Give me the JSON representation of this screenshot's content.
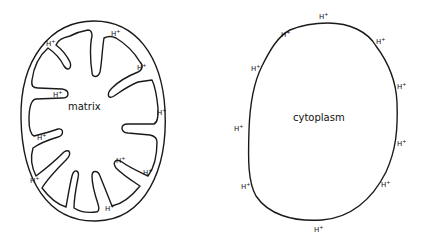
{
  "diagram": {
    "type": "hand-drawn biology sketch",
    "panels": [
      {
        "name": "mitochondrion",
        "region_label": "matrix",
        "ion_label": "H+",
        "ion_count": 10
      },
      {
        "name": "cell",
        "region_label": "cytoplasm",
        "ion_label": "H+",
        "ion_count": 10
      }
    ]
  },
  "labels": {
    "matrix": "matrix",
    "cytoplasm": "cytoplasm",
    "h": "H",
    "plus": "+"
  },
  "colors": {
    "ink": "#1a1a1a",
    "background": "#ffffff"
  }
}
